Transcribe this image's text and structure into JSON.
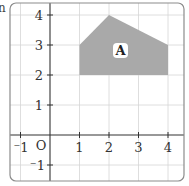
{
  "diagram": {
    "type": "coordinate-grid",
    "clipped_text": "n",
    "origin_label": "O",
    "x_ticks": [
      {
        "value": -1,
        "label": "⁻1"
      },
      {
        "value": 1,
        "label": "1"
      },
      {
        "value": 2,
        "label": "2"
      },
      {
        "value": 3,
        "label": "3"
      },
      {
        "value": 4,
        "label": "4"
      }
    ],
    "y_ticks": [
      {
        "value": 4,
        "label": "4"
      },
      {
        "value": 3,
        "label": "3"
      },
      {
        "value": 2,
        "label": "2"
      },
      {
        "value": 1,
        "label": "1"
      },
      {
        "value": -1,
        "label": "⁻1"
      }
    ],
    "x_range": [
      -1.5,
      4.5
    ],
    "y_range": [
      -1.5,
      4.3
    ],
    "shape": {
      "label": "A",
      "vertices": [
        [
          1,
          2
        ],
        [
          1,
          3
        ],
        [
          2,
          4
        ],
        [
          4,
          3
        ],
        [
          4,
          2
        ]
      ],
      "fill": "#a9a9a9"
    },
    "colors": {
      "grid": "#d6d6d6",
      "axis": "#333333",
      "frame": "#8c8c8c"
    }
  }
}
